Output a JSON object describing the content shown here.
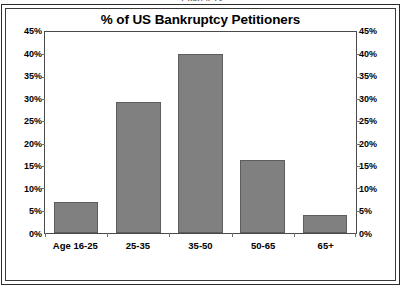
{
  "clipped_caption": "Chart 4-13",
  "chart_data": {
    "type": "bar",
    "title": "% of US Bankruptcy Petitioners",
    "xlabel": "",
    "ylabel": "",
    "categories": [
      "Age 16-25",
      "25-35",
      "35-50",
      "50-65",
      "65+"
    ],
    "values": [
      7.0,
      29.3,
      40.0,
      16.3,
      4.0
    ],
    "ylim": [
      0,
      45
    ],
    "ytick_step": 5,
    "ytick_labels": [
      "45%",
      "40%",
      "35%",
      "30%",
      "25%",
      "20%",
      "15%",
      "10%",
      "5%",
      "0%"
    ],
    "ytick_values": [
      45,
      40,
      35,
      30,
      25,
      20,
      15,
      10,
      5,
      0
    ],
    "right_axis": true,
    "right_ytick_labels": [
      "45%",
      "40%",
      "35%",
      "30%",
      "25%",
      "20%",
      "15%",
      "10%",
      "5%",
      "0%"
    ],
    "grid": false,
    "legend": false,
    "legend_position": "none",
    "bar_color": "#808080",
    "bar_edge_color": "#5d5d5d",
    "background_color": "#ffffff",
    "axis_color": "#4a4a4a",
    "text_color": "#000000",
    "series": [
      {
        "name": "% of US Bankruptcy Petitioners",
        "values": [
          7.0,
          29.3,
          40.0,
          16.3,
          4.0
        ]
      }
    ]
  }
}
